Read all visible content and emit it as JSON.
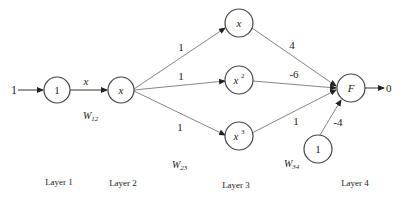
{
  "diagram": {
    "input": {
      "label": "1"
    },
    "output": {
      "label": "0"
    },
    "nodes": {
      "layer1": {
        "label": "1"
      },
      "layer2": {
        "label": "x"
      },
      "layer3_top": {
        "label": "x",
        "sup": ""
      },
      "layer3_mid": {
        "label": "x",
        "sup": "2"
      },
      "layer3_bot": {
        "label": "x",
        "sup": "3"
      },
      "layer4": {
        "label": "F"
      },
      "bias": {
        "label": "1"
      }
    },
    "edges": {
      "l1_l2": "x",
      "l2_top": "1",
      "l2_mid": "1",
      "l2_bot": "1",
      "top_f": "4",
      "mid_f": "-6",
      "bot_f": "1",
      "bias_f": "-4"
    },
    "weights": {
      "w12": {
        "base": "W",
        "sub": "12"
      },
      "w23": {
        "base": "W",
        "sub": "23"
      },
      "w34": {
        "base": "W",
        "sub": "34"
      }
    },
    "layers": [
      "Layer 1",
      "Layer 2",
      "Layer 3",
      "Layer 4"
    ]
  }
}
